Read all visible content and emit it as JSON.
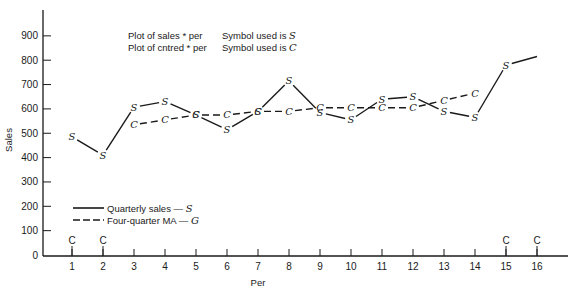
{
  "chart_data": {
    "type": "line",
    "title": "",
    "xlabel": "Per",
    "ylabel": "Sales",
    "xlim": [
      0,
      17
    ],
    "ylim": [
      0,
      1000
    ],
    "x_ticks": [
      1,
      2,
      3,
      4,
      5,
      6,
      7,
      8,
      9,
      10,
      11,
      12,
      13,
      14,
      15,
      16
    ],
    "y_ticks": [
      0,
      100,
      200,
      300,
      400,
      500,
      600,
      700,
      800,
      900
    ],
    "grid": false,
    "annotations": [
      {
        "text": "Plot of sales * per",
        "symbol_text": "Symbol used is",
        "symbol": "S"
      },
      {
        "text": "Plot of cntred * per",
        "symbol_text": "Symbol used is",
        "symbol": "C"
      }
    ],
    "axis_markers": [
      {
        "x": 1,
        "label": "C"
      },
      {
        "x": 2,
        "label": "C"
      },
      {
        "x": 15,
        "label": "C"
      },
      {
        "x": 16,
        "label": "C"
      }
    ],
    "legend": {
      "position": "lower-left",
      "entries": [
        {
          "label": "Quarterly sales — ",
          "symbol": "S",
          "style": "solid"
        },
        {
          "label": "Four-quarter MA — ",
          "symbol": "G",
          "style": "dashed"
        }
      ]
    },
    "series": [
      {
        "name": "Quarterly sales",
        "marker": "S",
        "style": "solid",
        "x": [
          1,
          2,
          3,
          4,
          5,
          6,
          7,
          8,
          9,
          10,
          11,
          12,
          13,
          14,
          15,
          16
        ],
        "values": [
          485,
          410,
          607,
          630,
          575,
          515,
          590,
          715,
          585,
          555,
          640,
          650,
          590,
          565,
          780,
          815
        ]
      },
      {
        "name": "Four-quarter MA",
        "marker": "C",
        "style": "dashed",
        "x": [
          3,
          4,
          5,
          6,
          7,
          8,
          9,
          10,
          11,
          12,
          13,
          14
        ],
        "values": [
          535,
          555,
          575,
          575,
          590,
          590,
          605,
          605,
          605,
          605,
          635,
          665
        ]
      }
    ]
  }
}
